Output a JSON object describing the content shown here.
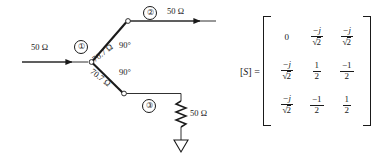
{
  "figure": {
    "type": "microwave-network-schematic",
    "colors": {
      "line": "#1a1a1a",
      "background": "#ffffff"
    }
  },
  "circuit": {
    "input_line": {
      "impedance_label": "50 Ω",
      "direction": "right"
    },
    "port1": {
      "number": "①"
    },
    "port2": {
      "number": "②",
      "output_impedance_label": "50 Ω"
    },
    "port3": {
      "number": "③",
      "termination_impedance_label": "50 Ω"
    },
    "branch_upper": {
      "impedance_label": "70.7 Ω",
      "electrical_length_label": "90°"
    },
    "branch_lower": {
      "impedance_label": "70.7 Ω",
      "electrical_length_label": "90°"
    },
    "ground_symbol": "ground-triangle",
    "resistor_symbol": "zigzag-resistor"
  },
  "matrix": {
    "label_open": "[",
    "label_symbol": "S",
    "label_close": "]",
    "equals": "=",
    "rows": [
      [
        {
          "kind": "plain",
          "text": "0"
        },
        {
          "kind": "frac",
          "num": "−j",
          "den_radical": "√",
          "den": "2"
        },
        {
          "kind": "frac",
          "num": "−j",
          "den_radical": "√",
          "den": "2"
        }
      ],
      [
        {
          "kind": "frac",
          "num": "−j",
          "den_radical": "√",
          "den": "2"
        },
        {
          "kind": "frac",
          "num": "1",
          "den": "2"
        },
        {
          "kind": "frac",
          "num": "−1",
          "den": "2"
        }
      ],
      [
        {
          "kind": "frac",
          "num": "−j",
          "den_radical": "√",
          "den": "2"
        },
        {
          "kind": "frac",
          "num": "−1",
          "den": "2"
        },
        {
          "kind": "frac",
          "num": "1",
          "den": "2"
        }
      ]
    ]
  }
}
